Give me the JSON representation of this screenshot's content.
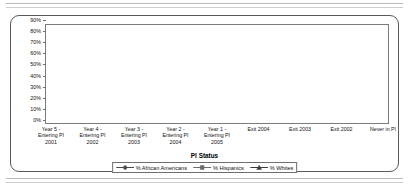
{
  "chart_data": {
    "type": "line",
    "title": "",
    "xlabel": "PI Status",
    "ylabel": "",
    "ylim": [
      0,
      90
    ],
    "ytick_step": 10,
    "grid": true,
    "legend_position": "bottom",
    "categories": [
      "Year 5 - Entering PI 2001",
      "Year 4 - Entering PI 2002",
      "Year 3 - Entering PI 2003",
      "Year 2 - Entering PI 2004",
      "Year 1 - Entering PI 2005",
      "Exit 2004",
      "Exit 2003",
      "Exit 2002",
      "Never in PI"
    ],
    "category_lines": [
      [
        "Year 5 -",
        "Entering PI",
        "2001"
      ],
      [
        "Year 4 -",
        "Entering PI",
        "2002"
      ],
      [
        "Year 3 -",
        "Entering PI",
        "2003"
      ],
      [
        "Year 2 -",
        "Entering PI",
        "2004"
      ],
      [
        "Year 1 -",
        "Entering PI",
        "2005"
      ],
      [
        "Exit 2004",
        "",
        ""
      ],
      [
        "Exit 2003",
        "",
        ""
      ],
      [
        "Exit 2002",
        "",
        ""
      ],
      [
        "Never in PI",
        "",
        ""
      ]
    ],
    "ytick_labels": [
      "0%",
      "10%",
      "20%",
      "30%",
      "40%",
      "50%",
      "60%",
      "70%",
      "80%",
      "90%"
    ],
    "ytick_values": [
      0,
      10,
      20,
      30,
      40,
      50,
      60,
      70,
      80,
      90
    ],
    "series": [
      {
        "name": "% African Americans",
        "marker": "diamond",
        "color": "#4a4a4a",
        "values": [
          13,
          11,
          13,
          11,
          18,
          14,
          18,
          25,
          32
        ]
      },
      {
        "name": "% Hispanics",
        "marker": "square",
        "color": "#6b6b6b",
        "values": [
          77,
          68,
          71,
          74,
          67,
          59,
          67,
          57,
          51
        ]
      },
      {
        "name": "% Whites",
        "marker": "triangle",
        "color": "#3d3d3d",
        "values": [
          5,
          11,
          10,
          9,
          9,
          10,
          9,
          10,
          10
        ]
      }
    ]
  },
  "legend": {
    "items": [
      {
        "label": "% African Americans",
        "marker": "diamond"
      },
      {
        "label": "% Hispanics",
        "marker": "square"
      },
      {
        "label": "% Whites",
        "marker": "triangle"
      }
    ]
  },
  "axis_title": "PI Status"
}
